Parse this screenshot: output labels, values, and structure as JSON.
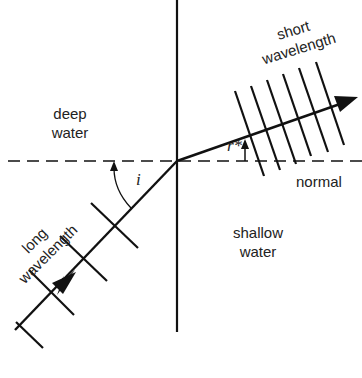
{
  "diagram": {
    "regions": {
      "upper": [
        "deep",
        "water"
      ],
      "lower": [
        "shallow",
        "water"
      ]
    },
    "labels": {
      "short_wavelength": [
        "short",
        "wavelength"
      ],
      "long_wavelength": [
        "long",
        "wavelength"
      ],
      "normal": "normal",
      "angle_incidence": "i",
      "angle_refraction": "r*"
    },
    "colors": {
      "line": "#111111",
      "text": "#222222",
      "background": "#ffffff"
    },
    "geometry": {
      "boundary_x": 177,
      "normal_y": 160,
      "intersection": [
        177,
        160
      ],
      "incident_start": [
        15,
        330
      ],
      "refracted_end": [
        357,
        98
      ],
      "long_wavefront_count": 4,
      "short_wavefront_count": 6
    }
  }
}
